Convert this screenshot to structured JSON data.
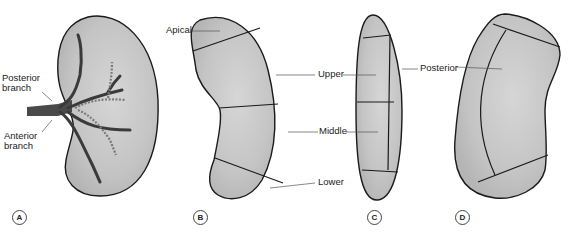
{
  "figure": {
    "colors": {
      "fill": "#c9c9c9",
      "outline": "#1a1a1a",
      "vessel": "#4a4a4a",
      "background": "#ffffff"
    },
    "panels": [
      {
        "id": "A",
        "letter": "A",
        "labels": {
          "posterior_branch": [
            "Posterior",
            "branch"
          ],
          "anterior_branch": [
            "Anterior",
            "branch"
          ]
        }
      },
      {
        "id": "B",
        "letter": "B",
        "labels": {
          "apical": "Apical",
          "upper": "Upper",
          "middle": "Middle",
          "lower": "Lower"
        }
      },
      {
        "id": "C",
        "letter": "C",
        "labels": {
          "posterior": "Posterior"
        }
      },
      {
        "id": "D",
        "letter": "D"
      }
    ]
  }
}
